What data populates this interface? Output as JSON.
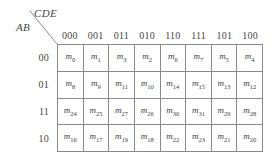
{
  "diagram": {
    "type": "karnaugh-map",
    "col_variables_label": "CDE",
    "row_variables_label": "AB",
    "column_headers": [
      "000",
      "001",
      "011",
      "010",
      "110",
      "111",
      "101",
      "100"
    ],
    "row_headers": [
      "00",
      "01",
      "11",
      "10"
    ],
    "cell_prefix": "m",
    "rows": [
      {
        "label": "00",
        "cells": [
          {
            "symbol": "m",
            "index": "0"
          },
          {
            "symbol": "m",
            "index": "1"
          },
          {
            "symbol": "m",
            "index": "3"
          },
          {
            "symbol": "m",
            "index": "2"
          },
          {
            "symbol": "m",
            "index": "6"
          },
          {
            "symbol": "m",
            "index": "7"
          },
          {
            "symbol": "m",
            "index": "5"
          },
          {
            "symbol": "m",
            "index": "4"
          }
        ]
      },
      {
        "label": "01",
        "cells": [
          {
            "symbol": "m",
            "index": "8"
          },
          {
            "symbol": "m",
            "index": "9"
          },
          {
            "symbol": "m",
            "index": "11"
          },
          {
            "symbol": "m",
            "index": "10"
          },
          {
            "symbol": "m",
            "index": "14"
          },
          {
            "symbol": "m",
            "index": "15"
          },
          {
            "symbol": "m",
            "index": "13"
          },
          {
            "symbol": "m",
            "index": "12"
          }
        ]
      },
      {
        "label": "11",
        "cells": [
          {
            "symbol": "m",
            "index": "24"
          },
          {
            "symbol": "m",
            "index": "25"
          },
          {
            "symbol": "m",
            "index": "27"
          },
          {
            "symbol": "m",
            "index": "26"
          },
          {
            "symbol": "m",
            "index": "30"
          },
          {
            "symbol": "m",
            "index": "31"
          },
          {
            "symbol": "m",
            "index": "29"
          },
          {
            "symbol": "m",
            "index": "28"
          }
        ]
      },
      {
        "label": "10",
        "cells": [
          {
            "symbol": "m",
            "index": "16"
          },
          {
            "symbol": "m",
            "index": "17"
          },
          {
            "symbol": "m",
            "index": "19"
          },
          {
            "symbol": "m",
            "index": "18"
          },
          {
            "symbol": "m",
            "index": "22"
          },
          {
            "symbol": "m",
            "index": "23"
          },
          {
            "symbol": "m",
            "index": "21"
          },
          {
            "symbol": "m",
            "index": "20"
          }
        ]
      }
    ],
    "colors": {
      "grid_line": "#8a8a8a",
      "text": "#3d3d3d",
      "background": "#ffffff"
    }
  }
}
